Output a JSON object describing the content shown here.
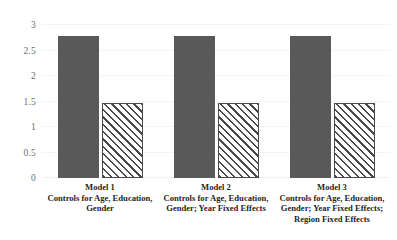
{
  "chart_data": {
    "type": "bar",
    "title": "",
    "subtitle": "",
    "xlabel": "",
    "ylabel": "",
    "ylim": [
      0,
      3
    ],
    "yticks": [
      "0",
      "0.5",
      "1",
      "1.5",
      "2",
      "2.5",
      "3"
    ],
    "ytick_values": [
      0,
      0.5,
      1,
      1.5,
      2,
      2.5,
      3
    ],
    "grid": true,
    "legend": "none",
    "categories": [
      "Model 1",
      "Model 2",
      "Model 3"
    ],
    "category_descriptions": [
      "Controls for Age, Education, Gender",
      "Controls for Age, Education, Gender; Year Fixed Effects",
      "Controls for Age, Education, Gender; Year Fixed Effects; Region Fixed Effects"
    ],
    "series": [
      {
        "name": "series-1-solid",
        "fill": "solid",
        "color": "#595959",
        "values": [
          2.78,
          2.78,
          2.78
        ]
      },
      {
        "name": "series-2-hatched",
        "fill": "diagonal-hatch",
        "color": "#ffffff",
        "hatch_color": "#4a4a4a",
        "values": [
          1.48,
          1.48,
          1.48
        ]
      }
    ]
  },
  "axis": {
    "y_labels": [
      {
        "text": "3",
        "value": 3
      },
      {
        "text": "2.5",
        "value": 2.5
      },
      {
        "text": "2",
        "value": 2
      },
      {
        "text": "1.5",
        "value": 1.5
      },
      {
        "text": "1",
        "value": 1
      },
      {
        "text": "0.5",
        "value": 0.5
      },
      {
        "text": "0",
        "value": 0
      }
    ]
  },
  "x_groups": [
    {
      "model": "Model 1",
      "lines": [
        "Controls for Age, Education,",
        "Gender"
      ]
    },
    {
      "model": "Model 2",
      "lines": [
        "Controls for Age, Education,",
        "Gender; Year Fixed Effects"
      ]
    },
    {
      "model": "Model 3",
      "lines": [
        "Controls for Age, Education,",
        "Gender; Year Fixed Effects;",
        "Region Fixed Effects"
      ]
    }
  ]
}
